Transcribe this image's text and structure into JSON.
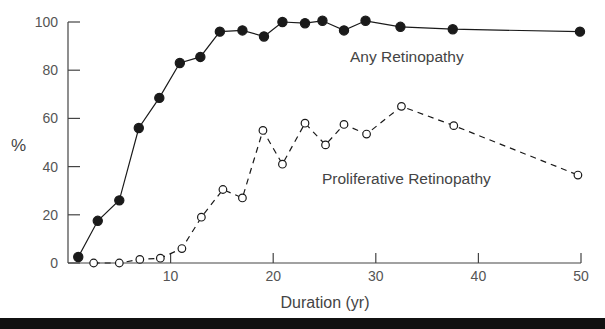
{
  "chart_data": {
    "type": "line",
    "title": "",
    "xlabel": "Duration (yr)",
    "ylabel": "%",
    "xlim": [
      0,
      50
    ],
    "ylim": [
      0,
      100
    ],
    "x_ticks": [
      10,
      20,
      30,
      40,
      50
    ],
    "y_ticks": [
      0,
      20,
      40,
      60,
      80,
      100
    ],
    "grid": false,
    "legend": "inline labels",
    "series": [
      {
        "name": "Any Retinopathy",
        "marker": "filled-circle",
        "line": "solid",
        "color": "#1a1a1a",
        "label_pos": {
          "x": 350,
          "y": 62
        },
        "points": [
          [
            1,
            2.5
          ],
          [
            2.9,
            17.5
          ],
          [
            5,
            26
          ],
          [
            6.9,
            56
          ],
          [
            8.9,
            68.5
          ],
          [
            10.9,
            83
          ],
          [
            12.9,
            85.5
          ],
          [
            14.8,
            96
          ],
          [
            17,
            96.5
          ],
          [
            19.1,
            94
          ],
          [
            20.9,
            100
          ],
          [
            23.1,
            99.5
          ],
          [
            24.8,
            100.5
          ],
          [
            26.9,
            96.5
          ],
          [
            29,
            100.5
          ],
          [
            32.4,
            98
          ],
          [
            37.5,
            97
          ],
          [
            49.9,
            96
          ]
        ]
      },
      {
        "name": "Proliferative Retinopathy",
        "marker": "open-circle",
        "line": "dashed",
        "color": "#1a1a1a",
        "label_pos": {
          "x": 322,
          "y": 184
        },
        "points": [
          [
            2.5,
            0
          ],
          [
            5,
            0
          ],
          [
            7,
            1.5
          ],
          [
            9,
            2
          ],
          [
            11.1,
            6
          ],
          [
            13,
            19
          ],
          [
            15.1,
            30.5
          ],
          [
            17,
            27
          ],
          [
            19,
            55
          ],
          [
            20.9,
            41
          ],
          [
            23.1,
            58
          ],
          [
            25.1,
            49
          ],
          [
            26.9,
            57.5
          ],
          [
            29.1,
            53.5
          ],
          [
            32.5,
            65
          ],
          [
            37.6,
            57
          ],
          [
            49.7,
            36.5
          ]
        ]
      }
    ]
  }
}
